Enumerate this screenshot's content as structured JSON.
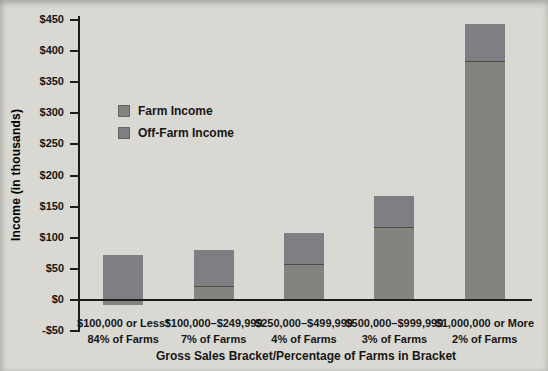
{
  "figure_caption": "",
  "colors": {
    "background": "#d9d8d2",
    "axis": "#1c1c1a",
    "farm_income": "#85837d",
    "off_farm_income": "#7d7f82",
    "segment_divider": "#4d4d48",
    "text": "#161614"
  },
  "legend": {
    "items": [
      {
        "label": "Farm Income",
        "color": "#85837d"
      },
      {
        "label": "Off-Farm Income",
        "color": "#7d7f82"
      }
    ]
  },
  "y_axis": {
    "title": "Income (in thousands)",
    "ticks": [
      {
        "label": "$450",
        "value": 450
      },
      {
        "label": "$400",
        "value": 400
      },
      {
        "label": "$350",
        "value": 350
      },
      {
        "label": "$300",
        "value": 300
      },
      {
        "label": "$250",
        "value": 250
      },
      {
        "label": "$200",
        "value": 200
      },
      {
        "label": "$150",
        "value": 150
      },
      {
        "label": "$100",
        "value": 100
      },
      {
        "label": "$50",
        "value": 50
      },
      {
        "label": "$0",
        "value": 0
      },
      {
        "label": "-$50",
        "value": -50
      }
    ]
  },
  "x_axis": {
    "title": "Gross Sales Bracket/Percentage of Farms in Bracket"
  },
  "chart_data": {
    "type": "bar",
    "stacked": true,
    "title": "",
    "xlabel": "Gross Sales Bracket/Percentage of Farms in Bracket",
    "ylabel": "Income (in thousands)",
    "ylim": [
      -50,
      450
    ],
    "ytick_step": 50,
    "grid": false,
    "legend_position": "upper-left-inside",
    "categories": [
      "$100,000 or Less*",
      "$100,000–$249,999",
      "$250,000–$499,999",
      "$500,000–$999,999",
      "$1,000,000 or More"
    ],
    "category_sublabels": [
      "84% of Farms",
      "7% of Farms",
      "4% of Farms",
      "3% of Farms",
      "2% of Farms"
    ],
    "series": [
      {
        "name": "Farm Income",
        "values": [
          -8,
          22,
          58,
          117,
          384
        ]
      },
      {
        "name": "Off-Farm Income",
        "values": [
          72,
          58,
          50,
          50,
          60
        ]
      }
    ]
  }
}
